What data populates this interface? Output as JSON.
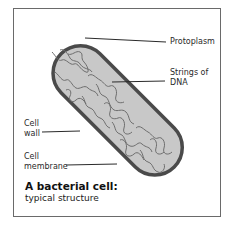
{
  "diagram": {
    "title": "A bacterial cell:",
    "subtitle": "typical structure",
    "labels": [
      {
        "id": "protoplasm",
        "text": "Protoplasm"
      },
      {
        "id": "dna",
        "line1": "Strings of",
        "line2": "DNA"
      },
      {
        "id": "cell-wall",
        "line1": "Cell",
        "line2": "wall"
      },
      {
        "id": "cell-membrane",
        "line1": "Cell",
        "line2": "membrane"
      }
    ],
    "colors": {
      "cell_wall": "#4a4a4a",
      "protoplasm_fill": "#c8c8c8",
      "dna_strands": "#6e6e6e",
      "leader_lines": "#2a2a2a",
      "frame": "#6a6a6a"
    }
  }
}
